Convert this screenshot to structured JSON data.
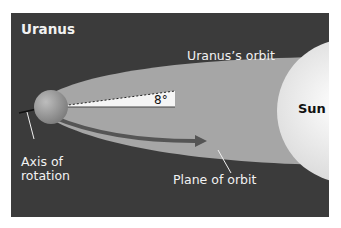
{
  "diagram": {
    "title": "Uranus",
    "labels": {
      "orbit": "Uranus’s orbit",
      "sun": "Sun",
      "angle": "8°",
      "axis_line1": "Axis of",
      "axis_line2": "rotation",
      "plane": "Plane of orbit"
    },
    "colors": {
      "background": "#3b3b3b",
      "orbit_fill": "#a6a6a6",
      "sun": "#ececec",
      "planet": "#9a9a9a",
      "angle_wedge": "#f5f5f5",
      "text_light": "#f2f2f2",
      "text_dark": "#111111"
    },
    "tilt_degrees": 8
  }
}
